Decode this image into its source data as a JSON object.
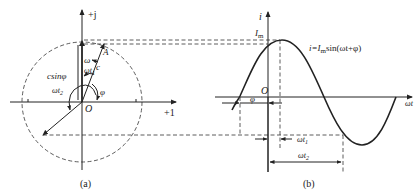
{
  "panel_a": {
    "caption": "(a)",
    "axis_imag_label": "+j",
    "axis_real_label": "+1",
    "origin_label": "O",
    "point_label": "A",
    "omega_label": "ω",
    "omega_t1_label": "ωt",
    "omega_t1_sub": "1",
    "omega_t2_label": "ωt",
    "omega_t2_sub": "2",
    "magnitude_label": "c",
    "projection_label": "csinφ",
    "phase_label": "φ"
  },
  "panel_b": {
    "caption": "(b)",
    "y_axis_label": "i",
    "x_axis_label": "ωt",
    "origin_label": "O",
    "peak_label": "I",
    "peak_sub": "m",
    "equation": "i=Imsin(ωt+φ)",
    "equation_parts": {
      "lhs": "i=",
      "I": "I",
      "m": "m",
      "rhs": "sin(ωt+φ)"
    },
    "phase_label": "φ",
    "omega_t1_label": "ωt",
    "omega_t1_sub": "1",
    "omega_t2_label": "ωt",
    "omega_t2_sub": "2"
  },
  "colors": {
    "line": "#222222",
    "background": "#ffffff"
  }
}
